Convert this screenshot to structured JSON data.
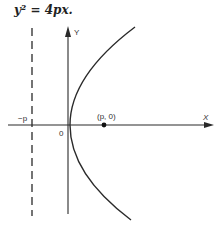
{
  "equation": "y² = 4px.",
  "axes": {
    "x_label": "X",
    "y_label": "Y",
    "origin_label": "0"
  },
  "directrix": {
    "label": "−p",
    "style": "dashed"
  },
  "focus": {
    "label": "(p, 0)"
  },
  "curve": {
    "type": "parabola",
    "opens": "right",
    "equation": "y^2 = 4px"
  },
  "colors": {
    "line": "#2a2a2a",
    "background": "#ffffff"
  }
}
